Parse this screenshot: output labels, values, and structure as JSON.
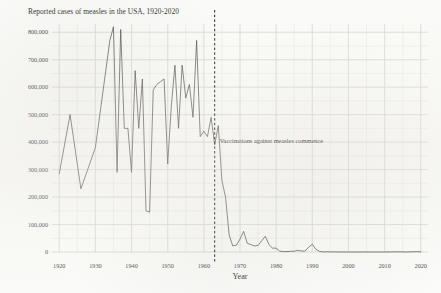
{
  "chart_data": {
    "type": "line",
    "title": "Reported cases of measles in the USA, 1920-2020",
    "xlabel": "Year",
    "ylabel": "",
    "xlim": [
      1918,
      2022
    ],
    "ylim": [
      0,
      830000
    ],
    "grid": true,
    "legend": false,
    "line_color": "#4a4a4a",
    "annotations": [
      {
        "name": "vaccination-line",
        "type": "vline",
        "x": 1963,
        "style": "dashed",
        "color": "#1a1a1a",
        "text": "Vaccinations against measles commence"
      }
    ],
    "y_ticks": [
      0,
      100000,
      200000,
      300000,
      400000,
      500000,
      600000,
      700000,
      800000
    ],
    "y_tick_labels": [
      "0",
      "100,000",
      "200,000",
      "300,000",
      "400,000",
      "500,000",
      "600,000",
      "700,000",
      "800,000"
    ],
    "x_ticks": [
      1920,
      1930,
      1940,
      1950,
      1960,
      1970,
      1980,
      1990,
      2000,
      2010,
      2020
    ],
    "x_tick_labels": [
      "1920",
      "1930",
      "1940",
      "1950",
      "1960",
      "1970",
      "1980",
      "1990",
      "2000",
      "2010",
      "2020"
    ],
    "x": [
      1920,
      1923,
      1926,
      1930,
      1934,
      1935,
      1936,
      1937,
      1938,
      1939,
      1940,
      1941,
      1942,
      1943,
      1944,
      1945,
      1946,
      1947,
      1948,
      1949,
      1950,
      1951,
      1952,
      1953,
      1954,
      1955,
      1956,
      1957,
      1958,
      1959,
      1960,
      1961,
      1962,
      1963,
      1964,
      1965,
      1966,
      1967,
      1968,
      1969,
      1970,
      1971,
      1972,
      1973,
      1974,
      1975,
      1976,
      1977,
      1978,
      1979,
      1980,
      1981,
      1982,
      1983,
      1984,
      1985,
      1986,
      1987,
      1988,
      1989,
      1990,
      1991,
      1992,
      1993,
      1994,
      1995,
      1996,
      1998,
      2000,
      2005,
      2010,
      2014,
      2016,
      2019,
      2020
    ],
    "y": [
      285000,
      500000,
      230000,
      380000,
      770000,
      820000,
      290000,
      810000,
      450000,
      450000,
      290000,
      660000,
      450000,
      630000,
      150000,
      145000,
      590000,
      610000,
      620000,
      630000,
      320000,
      530000,
      680000,
      450000,
      680000,
      560000,
      610000,
      490000,
      770000,
      420000,
      440000,
      420000,
      490000,
      390000,
      460000,
      260000,
      200000,
      62000,
      22000,
      25000,
      47000,
      75000,
      32000,
      27000,
      22000,
      24000,
      41000,
      57000,
      27000,
      14000,
      14000,
      3000,
      1700,
      1500,
      2600,
      2800,
      6300,
      3700,
      3400,
      18000,
      28000,
      9600,
      2200,
      310,
      960,
      310,
      510,
      100,
      86,
      66,
      63,
      670,
      86,
      1280,
      13
    ]
  }
}
